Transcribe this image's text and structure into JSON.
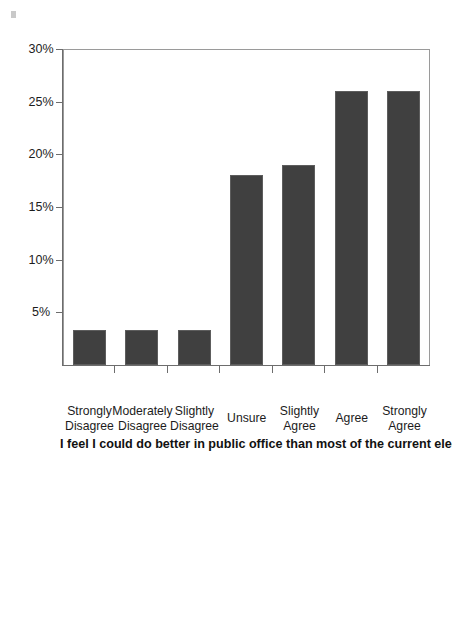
{
  "figure": {
    "title": "Figure 3.6   VFP Efficacy",
    "speck_name": "scan-artifact"
  },
  "chart_data": {
    "type": "bar",
    "orientation": "vertical",
    "title": "Figure 3.6   VFP Efficacy",
    "xlabel": "I feel I could do better in public office than most of the current elected officials.",
    "ylabel": "",
    "categories": [
      "Strongly Agree",
      "Agree",
      "Slightly Agree",
      "Unsure",
      "Slightly Disagree",
      "Moderately Disagree",
      "Strongly Disagree"
    ],
    "category_lines": [
      [
        "Strongly",
        "Agree"
      ],
      [
        "Agree",
        ""
      ],
      [
        "Slightly",
        "Agree"
      ],
      [
        "Unsure",
        ""
      ],
      [
        "Slightly",
        "Disagree"
      ],
      [
        "Moderately",
        "Disagree"
      ],
      [
        "Strongly",
        "Disagree"
      ]
    ],
    "values": [
      26,
      26,
      19,
      18,
      3.3,
      3.3,
      3.3
    ],
    "value_unit": "%",
    "ylim": [
      0,
      30
    ],
    "yticks": [
      5,
      10,
      15,
      20,
      25,
      30
    ],
    "ytick_labels": [
      "5%",
      "10%",
      "15%",
      "20%",
      "25%",
      "30%"
    ],
    "grid": false,
    "legend": false,
    "bar_color": "#404040",
    "axis_color": "#6d6d6d",
    "frame_color": "#9a9a9a"
  },
  "axis_title": "I feel I could do better in public office than most of the current elected officials."
}
